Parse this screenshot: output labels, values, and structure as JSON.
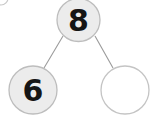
{
  "diagram": {
    "type": "number-bond",
    "whole": {
      "name": "whole-node",
      "value": "8",
      "filled": true,
      "cx": 78.5,
      "cy": 20,
      "r": 21.5
    },
    "parts": [
      {
        "name": "part-node-left",
        "value": "6",
        "filled": true,
        "cx": 33,
        "cy": 90,
        "r": 24
      },
      {
        "name": "part-node-right",
        "value": "",
        "filled": false,
        "cx": 125,
        "cy": 90,
        "r": 24
      }
    ],
    "connectors": [
      {
        "name": "connector-left",
        "x1": 63,
        "y1": 36,
        "x2": 44,
        "y2": 68
      },
      {
        "name": "connector-right",
        "x1": 95,
        "y1": 36,
        "x2": 113,
        "y2": 68
      }
    ],
    "corner_fragment": {
      "name": "corner-circle-fragment",
      "cx": 1,
      "cy": -2,
      "r": 7
    },
    "colors": {
      "node_fill": "#ececec",
      "node_fill_empty": "#ffffff",
      "node_stroke": "#bdbdbd",
      "connector": "#9a9a9a",
      "text": "#151515",
      "background": "#ffffff"
    }
  }
}
